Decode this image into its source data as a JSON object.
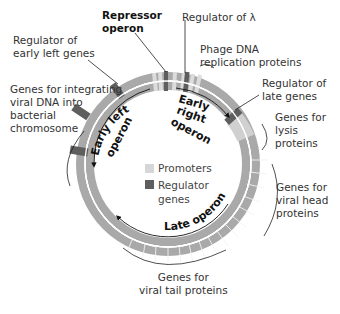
{
  "labels": {
    "repressor_operon": "Repressor\noperon",
    "regulator_lambda": "Regulator of λ",
    "regulator_early_left": "Regulator of\nearly left genes",
    "phage_dna_replication": "Phage DNA\nreplication proteins",
    "regulator_late": "Regulator of\nlate genes",
    "integrating_genes": "Genes for integrating\nviral DNA into\nbacterial\nchromosome",
    "lysis_genes": "Genes for\nlysis\nproteins",
    "head_genes": "Genes for\nviral head\nproteins",
    "tail_genes": "Genes for\nviral tail proteins"
  },
  "operons": {
    "early_left": "Early left operon",
    "early_right": "Early right operon",
    "late": "Late operon"
  },
  "legend": {
    "promoters": "Promoters",
    "regulator_genes": "Regulator\ngenes"
  },
  "colors": {
    "ring": "#a9a9a9",
    "promoter": "#d6d6d6",
    "regulator": "#5e5e5e",
    "text": "#333333"
  }
}
